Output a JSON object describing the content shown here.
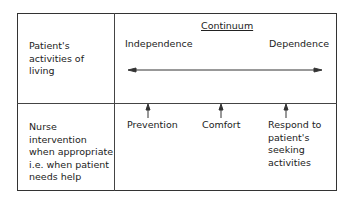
{
  "diagram": {
    "title": "Continuum",
    "rows": [
      {
        "label": "Patient's\nactivities of\nliving"
      },
      {
        "label": "Nurse\nintervention\nwhen appropriate\ni.e. when patient\nneeds help"
      }
    ],
    "continuum_ends": {
      "left": "Independence",
      "right": "Dependence"
    },
    "interventions": [
      "Prevention",
      "Comfort",
      "Respond to\npatient's\nseeking\nactivities"
    ]
  }
}
